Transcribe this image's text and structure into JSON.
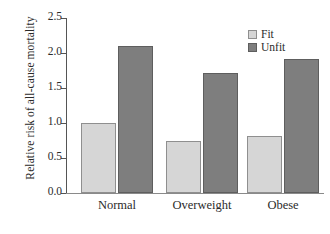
{
  "chart_data": {
    "type": "bar",
    "title": "",
    "xlabel": "",
    "ylabel": "Relative risk of all-cause mortality",
    "categories": [
      "Normal",
      "Overweight",
      "Obese"
    ],
    "series": [
      {
        "name": "Fit",
        "color": "#d6d6d6",
        "values": [
          1.0,
          0.75,
          0.81
        ]
      },
      {
        "name": "Unfit",
        "color": "#7e7e7e",
        "values": [
          2.1,
          1.71,
          1.92
        ]
      }
    ],
    "ylim": [
      0.0,
      2.5
    ],
    "ytick_labels": [
      "0.0",
      "0.5",
      "1.0",
      "1.5",
      "2.0",
      "2.5"
    ],
    "ytick_values": [
      0.0,
      0.5,
      1.0,
      1.5,
      2.0,
      2.5
    ],
    "grid": false,
    "legend_position": "top-right"
  }
}
